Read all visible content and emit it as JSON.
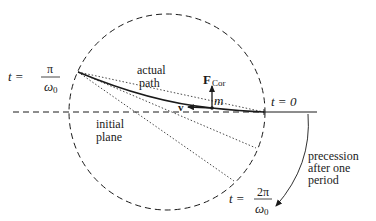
{
  "figure": {
    "colors": {
      "ink": "#1a1a1a",
      "background": "#ffffff"
    }
  },
  "labels": {
    "t_start": {
      "lhs": "t =",
      "num": "π",
      "den": "ω0",
      "den_main": "ω",
      "den_sub": "0"
    },
    "t_zero": "t = 0",
    "t_period": {
      "lhs": "t =",
      "num": "2π",
      "den_main": "ω",
      "den_sub": "0"
    },
    "actual_path": [
      "actual",
      "path"
    ],
    "initial_plane": [
      "initial",
      "plane"
    ],
    "coriolis_force": {
      "main": "F",
      "sub": "Cor"
    },
    "velocity": "v",
    "mass": "m",
    "precession": [
      "precession",
      "after one",
      "period"
    ]
  },
  "geometry": {
    "circle": {
      "cx": 167,
      "cy": 112,
      "r": 98,
      "style": "dashed"
    },
    "initial_plane_line": {
      "x1": 13,
      "y": 112,
      "x2": 264,
      "style": "dashed"
    },
    "post_line": {
      "x1": 264,
      "x2": 317,
      "y": 112,
      "style": "solid"
    },
    "path_start": {
      "x": 78,
      "y": 72
    },
    "mass_point": {
      "x": 212,
      "y": 108
    },
    "dotted_lines": [
      {
        "x2": 264,
        "y2": 112
      },
      {
        "x2": 256,
        "y2": 148
      },
      {
        "x2": 234,
        "y2": 181
      }
    ]
  }
}
